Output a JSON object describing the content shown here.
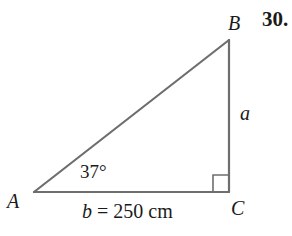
{
  "problem": {
    "number": "30."
  },
  "triangle": {
    "vertices": {
      "A": {
        "label": "A",
        "x": 34,
        "y": 192
      },
      "B": {
        "label": "B",
        "x": 229,
        "y": 40
      },
      "C": {
        "label": "C",
        "x": 229,
        "y": 192
      }
    },
    "angle_A": {
      "label": "37°"
    },
    "right_angle_at": "C",
    "sides": {
      "a": {
        "label": "a"
      },
      "b": {
        "var": "b",
        "equals": " = 250 cm"
      }
    }
  },
  "colors": {
    "stroke": "#6e6e6e",
    "text": "#1a1a1a",
    "background": "#ffffff"
  }
}
